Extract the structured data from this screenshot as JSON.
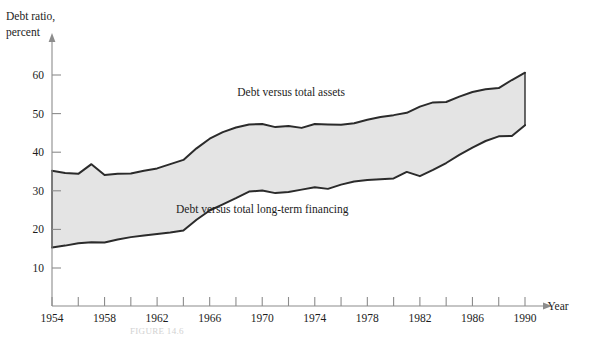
{
  "figure": {
    "caption": "FIGURE 14.6",
    "y_axis_title_line1": "Debt ratio,",
    "y_axis_title_line2": "percent",
    "x_axis_title": "Year"
  },
  "chart_data": {
    "type": "area",
    "title": "",
    "subtitle": "",
    "xlabel": "Year",
    "ylabel": "Debt ratio, percent",
    "xlim": [
      1954,
      1990
    ],
    "ylim": [
      0,
      65
    ],
    "yticks": [
      10,
      20,
      30,
      40,
      50,
      60
    ],
    "ytick_labels": [
      "10",
      "20",
      "30",
      "40",
      "50",
      "60"
    ],
    "xticks": [
      1954,
      1956,
      1958,
      1960,
      1962,
      1964,
      1966,
      1968,
      1970,
      1972,
      1974,
      1976,
      1978,
      1980,
      1982,
      1984,
      1986,
      1988,
      1990
    ],
    "xtick_labels": [
      "1954",
      "",
      "1958",
      "",
      "1962",
      "",
      "1966",
      "",
      "1970",
      "",
      "1974",
      "",
      "1978",
      "",
      "1982",
      "",
      "1986",
      "",
      "1990"
    ],
    "grid": false,
    "legend_position": "inline-annotations",
    "annotations": [
      {
        "text": "Debt versus total assets",
        "x": 1972.2,
        "y": 54.5
      },
      {
        "text": "Debt versus total long-term financing",
        "x": 1970.0,
        "y": 24.2
      }
    ],
    "x": [
      1954,
      1955,
      1956,
      1957,
      1958,
      1959,
      1960,
      1961,
      1962,
      1963,
      1964,
      1965,
      1966,
      1967,
      1968,
      1969,
      1970,
      1971,
      1972,
      1973,
      1974,
      1975,
      1976,
      1977,
      1978,
      1979,
      1980,
      1981,
      1982,
      1983,
      1984,
      1985,
      1986,
      1987,
      1988,
      1989,
      1990
    ],
    "series": [
      {
        "name": "Debt versus total assets",
        "values": [
          35.2,
          34.6,
          34.4,
          36.9,
          34.1,
          34.4,
          34.5,
          35.2,
          35.8,
          36.9,
          38.0,
          41.0,
          43.5,
          45.2,
          46.4,
          47.2,
          47.3,
          46.5,
          46.8,
          46.3,
          47.3,
          47.2,
          47.1,
          47.5,
          48.4,
          49.1,
          49.6,
          50.2,
          51.8,
          52.9,
          53.0,
          54.4,
          55.6,
          56.3,
          56.6,
          58.7,
          60.6
        ]
      },
      {
        "name": "Debt versus total long-term financing",
        "values": [
          15.3,
          15.8,
          16.4,
          16.7,
          16.6,
          17.4,
          18.0,
          18.4,
          18.8,
          19.2,
          19.7,
          22.5,
          24.9,
          26.5,
          28.1,
          29.8,
          30.1,
          29.4,
          29.7,
          30.3,
          30.9,
          30.5,
          31.6,
          32.4,
          32.8,
          33.0,
          33.2,
          34.9,
          33.8,
          35.4,
          37.2,
          39.3,
          41.2,
          42.9,
          44.1,
          44.2,
          47.0
        ]
      }
    ]
  }
}
